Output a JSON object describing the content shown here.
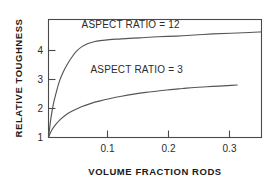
{
  "chart_data": {
    "type": "line",
    "title": "",
    "xlabel": "VOLUME FRACTION RODS",
    "ylabel": "RELATIVE TOUGHNESS",
    "xlim": [
      0,
      0.35
    ],
    "ylim": [
      1,
      4.35
    ],
    "grid": false,
    "legend": "inline-annotations",
    "xticks": [
      0.1,
      0.2,
      0.3
    ],
    "xtick_labels": [
      "0.1",
      "0.2",
      "0.3"
    ],
    "yticks": [
      1,
      2,
      3,
      4
    ],
    "ytick_labels": [
      "1",
      "2",
      "3",
      "4"
    ],
    "series": [
      {
        "name": "ASPECT RATIO = 12",
        "label": "ASPECT RATIO = 12",
        "x": [
          0.0,
          0.004,
          0.008,
          0.013,
          0.018,
          0.024,
          0.03,
          0.038,
          0.046,
          0.055,
          0.065,
          0.075,
          0.085,
          0.1,
          0.12,
          0.15,
          0.18,
          0.21,
          0.24,
          0.27,
          0.3,
          0.33,
          0.35
        ],
        "y": [
          1.0,
          1.55,
          1.95,
          2.3,
          2.6,
          2.85,
          3.05,
          3.27,
          3.45,
          3.58,
          3.67,
          3.72,
          3.75,
          3.78,
          3.8,
          3.83,
          3.86,
          3.88,
          3.91,
          3.94,
          3.96,
          3.98,
          4.0
        ]
      },
      {
        "name": "ASPECT RATIO = 3",
        "label": "ASPECT RATIO = 3",
        "x": [
          0.0,
          0.005,
          0.012,
          0.02,
          0.03,
          0.04,
          0.055,
          0.07,
          0.085,
          0.1,
          0.12,
          0.14,
          0.16,
          0.18,
          0.2,
          0.22,
          0.24,
          0.26,
          0.28,
          0.3,
          0.31
        ],
        "y": [
          1.0,
          1.2,
          1.37,
          1.52,
          1.66,
          1.76,
          1.88,
          1.97,
          2.04,
          2.1,
          2.17,
          2.23,
          2.28,
          2.32,
          2.36,
          2.39,
          2.42,
          2.44,
          2.46,
          2.48,
          2.49
        ]
      }
    ],
    "annotations": [
      {
        "text": "ASPECT RATIO = 12",
        "x": 0.135,
        "y": 4.12
      },
      {
        "text": "ASPECT RATIO = 3",
        "x": 0.145,
        "y": 2.82
      }
    ]
  }
}
